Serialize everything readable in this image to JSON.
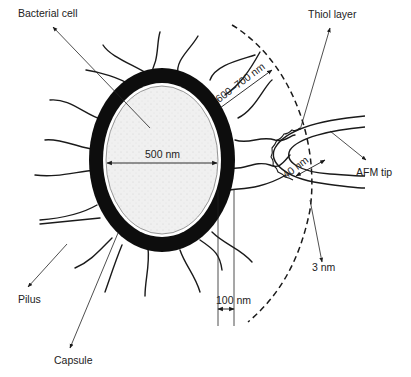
{
  "diagram": {
    "labels": {
      "bacterial_cell": "Bacterial cell",
      "thiol_layer": "Thiol layer",
      "cell_width": "500 nm",
      "pili_length": "600–700 nm",
      "afm_tip": "AFM tip",
      "tip_radius": "40 nm",
      "thiol_thickness": "3 nm",
      "capsule_thickness": "100 nm",
      "pilus": "Pilus",
      "capsule": "Capsule"
    },
    "colors": {
      "ink": "#1a1a1a",
      "cytoplasm": "#eeeeee",
      "capsule": "#0d0d0d",
      "background": "#ffffff"
    }
  }
}
